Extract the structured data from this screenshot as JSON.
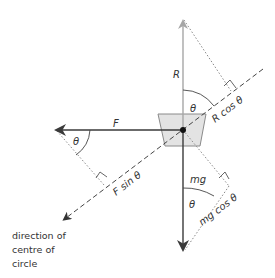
{
  "diagram": {
    "type": "force-diagram",
    "forces": [
      {
        "id": "R",
        "label": "R",
        "direction": "up",
        "color": "#a6a6a6"
      },
      {
        "id": "F",
        "label": "F",
        "direction": "left",
        "color": "#3a3a3a"
      },
      {
        "id": "mg",
        "label": "mg",
        "direction": "down",
        "color": "#3a3a3a"
      }
    ],
    "components": {
      "r_cos": "R cos θ",
      "f_sin": "F sin θ",
      "mg_cos": "mg cos θ"
    },
    "angles": {
      "theta_top": "θ",
      "theta_left": "θ",
      "theta_bottom": "θ"
    },
    "caption": {
      "line1": "direction of",
      "line2": "centre of",
      "line3": "circle"
    },
    "colors": {
      "r_arrow": "#a6a6a6",
      "dark_arrow": "#3a3a3a",
      "block_fill": "#e3e3e3",
      "block_stroke": "#8a8a8a",
      "dashed": "#444444",
      "dotted": "#8a8a8a"
    }
  }
}
